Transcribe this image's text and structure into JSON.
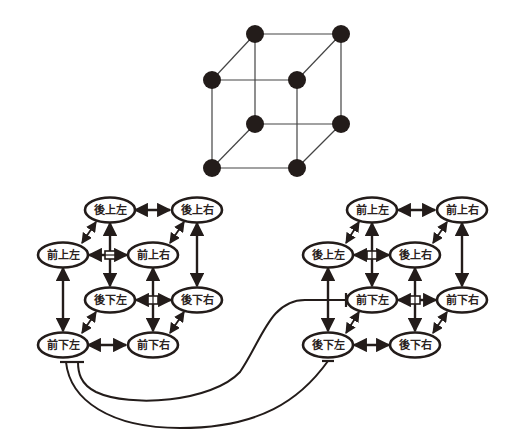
{
  "colors": {
    "ink": "#231c1a",
    "background": "#ffffff"
  },
  "cube": {
    "vertices": [
      {
        "id": "c1",
        "x": 255,
        "y": 34
      },
      {
        "id": "c2",
        "x": 341,
        "y": 34
      },
      {
        "id": "c3",
        "x": 212,
        "y": 80
      },
      {
        "id": "c4",
        "x": 297,
        "y": 80
      },
      {
        "id": "c5",
        "x": 255,
        "y": 124
      },
      {
        "id": "c6",
        "x": 341,
        "y": 124
      },
      {
        "id": "c7",
        "x": 212,
        "y": 168
      },
      {
        "id": "c8",
        "x": 297,
        "y": 168
      }
    ],
    "edges": [
      [
        "c1",
        "c2"
      ],
      [
        "c3",
        "c4"
      ],
      [
        "c1",
        "c3"
      ],
      [
        "c2",
        "c4"
      ],
      [
        "c5",
        "c6"
      ],
      [
        "c7",
        "c8"
      ],
      [
        "c5",
        "c7"
      ],
      [
        "c6",
        "c8"
      ],
      [
        "c1",
        "c5"
      ],
      [
        "c2",
        "c6"
      ],
      [
        "c3",
        "c7"
      ],
      [
        "c4",
        "c8"
      ]
    ]
  },
  "left_graph": {
    "nodes": [
      {
        "id": "L_bul",
        "label": "後上左",
        "x": 110,
        "y": 210
      },
      {
        "id": "L_bur",
        "label": "後上右",
        "x": 197,
        "y": 210
      },
      {
        "id": "L_ful",
        "label": "前上左",
        "x": 63,
        "y": 255
      },
      {
        "id": "L_fur",
        "label": "前上右",
        "x": 153,
        "y": 255
      },
      {
        "id": "L_bdl",
        "label": "後下左",
        "x": 110,
        "y": 300
      },
      {
        "id": "L_bdr",
        "label": "後下右",
        "x": 197,
        "y": 300
      },
      {
        "id": "L_fdl",
        "label": "前下左",
        "x": 63,
        "y": 345
      },
      {
        "id": "L_fdr",
        "label": "前下右",
        "x": 153,
        "y": 345
      }
    ]
  },
  "right_graph": {
    "nodes": [
      {
        "id": "R_ful",
        "label": "前上左",
        "x": 372,
        "y": 210
      },
      {
        "id": "R_fur",
        "label": "前上右",
        "x": 462,
        "y": 210
      },
      {
        "id": "R_bul",
        "label": "後上左",
        "x": 328,
        "y": 255
      },
      {
        "id": "R_bur",
        "label": "後上右",
        "x": 415,
        "y": 255
      },
      {
        "id": "R_fdl",
        "label": "前下左",
        "x": 372,
        "y": 300
      },
      {
        "id": "R_fdr",
        "label": "前下右",
        "x": 462,
        "y": 300
      },
      {
        "id": "R_bdl",
        "label": "後下左",
        "x": 328,
        "y": 345
      },
      {
        "id": "R_bdr",
        "label": "後下右",
        "x": 415,
        "y": 345
      }
    ]
  },
  "legend_labels": {
    "front": "前",
    "back": "後",
    "up": "上",
    "down": "下",
    "left": "左",
    "right": "右"
  }
}
